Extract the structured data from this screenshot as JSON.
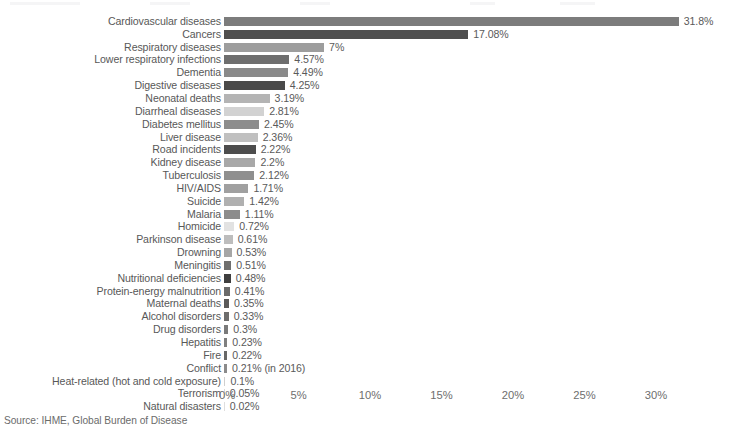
{
  "source_note": "Source: IHME, Global Burden of Disease",
  "axis": {
    "ticks": [
      "0%",
      "5%",
      "10%",
      "15%",
      "20%",
      "25%",
      "30%"
    ],
    "tick_values": [
      0,
      5,
      10,
      15,
      20,
      25,
      30
    ]
  },
  "chart_data": {
    "type": "bar",
    "orientation": "horizontal",
    "title": "",
    "subtitle": "",
    "xlabel": "",
    "ylabel": "",
    "xlim": [
      0,
      30
    ],
    "grid": false,
    "legend": "none",
    "unit": "%",
    "note": "Source: IHME, Global Burden of Disease",
    "categories": [
      "Cardiovascular diseases",
      "Cancers",
      "Respiratory diseases",
      "Lower respiratory infections",
      "Dementia",
      "Digestive diseases",
      "Neonatal deaths",
      "Diarrheal diseases",
      "Diabetes mellitus",
      "Liver disease",
      "Road incidents",
      "Kidney disease",
      "Tuberculosis",
      "HIV/AIDS",
      "Suicide",
      "Malaria",
      "Homicide",
      "Parkinson disease",
      "Drowning",
      "Meningitis",
      "Nutritional deficiencies",
      "Protein-energy malnutrition",
      "Maternal deaths",
      "Alcohol disorders",
      "Drug disorders",
      "Hepatitis",
      "Fire",
      "Conflict",
      "Heat-related (hot and cold exposure)",
      "Terrorism",
      "Natural disasters"
    ],
    "values": [
      31.8,
      17.08,
      7,
      4.57,
      4.49,
      4.25,
      3.19,
      2.81,
      2.45,
      2.36,
      2.22,
      2.2,
      2.12,
      1.71,
      1.42,
      1.11,
      0.72,
      0.61,
      0.53,
      0.51,
      0.48,
      0.41,
      0.35,
      0.33,
      0.3,
      0.23,
      0.22,
      0.21,
      0.1,
      0.05,
      0.02
    ],
    "value_labels": [
      "31.8%",
      "17.08%",
      "7%",
      "4.57%",
      "4.49%",
      "4.25%",
      "3.19%",
      "2.81%",
      "2.45%",
      "2.36%",
      "2.22%",
      "2.2%",
      "2.12%",
      "1.71%",
      "1.42%",
      "1.11%",
      "0.72%",
      "0.61%",
      "0.53%",
      "0.51%",
      "0.48%",
      "0.41%",
      "0.35%",
      "0.33%",
      "0.3%",
      "0.23%",
      "0.22%",
      "0.21% (in 2016)",
      "0.1%",
      "0.05%",
      "0.02%"
    ],
    "bar_colors": [
      "#7c7c7c",
      "#4f4f4f",
      "#9d9d9d",
      "#6e6e6e",
      "#8a8a8a",
      "#4a4a4a",
      "#b4b4b4",
      "#d2d2d2",
      "#8d8d8d",
      "#c0c0c0",
      "#4d4d4d",
      "#a8a8a8",
      "#8f8f8f",
      "#a0a0a0",
      "#b0b0b0",
      "#8c8c8c",
      "#e2e2e2",
      "#bdbdbd",
      "#a6a6a6",
      "#6f6f6f",
      "#3f3f3f",
      "#6a6a6a",
      "#5a5a5a",
      "#6d6d6d",
      "#7a7a7a",
      "#7f7f7f",
      "#686868",
      "#8b8b8b",
      "#cfcfcf",
      "#d8d8d8",
      "#dedede"
    ]
  }
}
